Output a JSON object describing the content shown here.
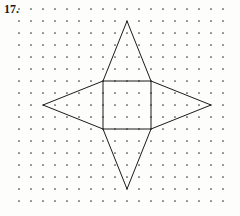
{
  "page": {
    "problem_number": "17.",
    "background_color": "#fdfdfc",
    "ink_color": "#1a1a1a",
    "dot_color": "#3a3a3a"
  },
  "dot_grid": {
    "name": "dot-lattice",
    "columns": 18,
    "rows": 17,
    "spacing_px": 12,
    "origin_x": 19,
    "origin_y": 9,
    "dot_radius_px": 0.85
  },
  "figure": {
    "name": "four-pointed-star",
    "parts": [
      {
        "name": "center-square",
        "type": "square",
        "points": "103,81 151,81 151,129 103,129 103,81"
      },
      {
        "name": "top-triangle",
        "type": "triangle",
        "points": "103,81 127,21 151,81"
      },
      {
        "name": "bottom-triangle",
        "type": "triangle",
        "points": "103,129 127,189 151,129"
      },
      {
        "name": "left-triangle",
        "type": "triangle",
        "points": "103,81 43,105 103,129"
      },
      {
        "name": "right-triangle",
        "type": "triangle",
        "points": "151,81 211,105 151,129"
      }
    ],
    "vertices": {
      "top_apex": "127,21",
      "bottom_apex": "127,189",
      "left_apex": "43,105",
      "right_apex": "211,105",
      "square_top_left": "103,81",
      "square_top_right": "151,81",
      "square_bottom_right": "151,129",
      "square_bottom_left": "103,129"
    }
  }
}
